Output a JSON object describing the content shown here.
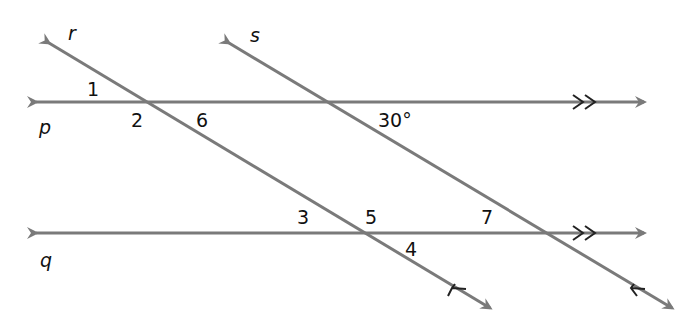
{
  "diagram": {
    "line_color": "#7a7a7a",
    "mark_color": "#222222",
    "lines": {
      "p": "p",
      "q": "q",
      "r": "r",
      "s": "s"
    },
    "angles": {
      "a1": "1",
      "a2": "2",
      "a3": "3",
      "a4": "4",
      "a5": "5",
      "a6": "6",
      "a7": "7",
      "given": "30°"
    }
  }
}
